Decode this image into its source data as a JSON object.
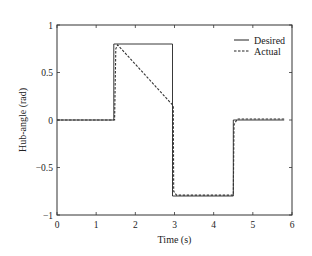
{
  "chart_data": {
    "type": "line",
    "title": "",
    "xlabel": "Time (s)",
    "ylabel": "Hub-angle (rad)",
    "xlim": [
      0,
      6
    ],
    "ylim": [
      -1,
      1
    ],
    "xticks": [
      "0",
      "1",
      "2",
      "3",
      "4",
      "5",
      "6"
    ],
    "yticks": [
      "1",
      "0.5",
      "0",
      "−0.5",
      "−1"
    ],
    "grid": false,
    "legend_position": "upper right",
    "series": [
      {
        "name": "Desired",
        "style": "solid",
        "x": [
          0,
          1.45,
          1.45,
          2.95,
          2.95,
          4.5,
          4.5,
          5.8
        ],
        "y": [
          0,
          0,
          0.8,
          0.8,
          -0.8,
          -0.8,
          0,
          0
        ]
      },
      {
        "name": "Actual",
        "style": "dashed",
        "x": [
          0,
          1.47,
          1.5,
          1.55,
          2.97,
          2.98,
          3.05,
          4.5,
          4.52,
          4.6,
          5.8
        ],
        "y": [
          0,
          0,
          0.75,
          0.79,
          0.15,
          -0.75,
          -0.79,
          -0.79,
          -0.05,
          0.01,
          0.01
        ]
      }
    ]
  },
  "legend": {
    "items": [
      {
        "label": "Desired"
      },
      {
        "label": "Actual"
      }
    ]
  }
}
